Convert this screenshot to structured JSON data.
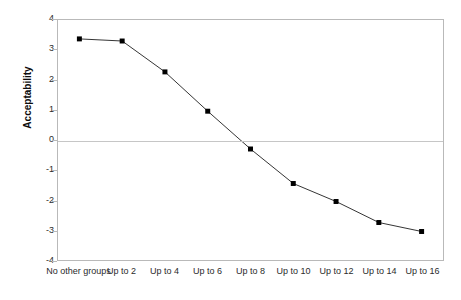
{
  "chart_data": {
    "type": "line",
    "title": "",
    "xlabel": "",
    "ylabel": "Acceptability",
    "categories": [
      "No other groups",
      "Up to 2",
      "Up to 4",
      "Up to 6",
      "Up to 8",
      "Up to 10",
      "Up to 12",
      "Up to 14",
      "Up to 16"
    ],
    "values": [
      3.37,
      3.3,
      2.27,
      0.96,
      -0.3,
      -1.45,
      -2.05,
      -2.75,
      -3.05
    ],
    "ylim": [
      -4,
      4
    ],
    "yticks": [
      4,
      3,
      2,
      1,
      0,
      -1,
      -2,
      -3,
      -4
    ],
    "ytick_labels": [
      "4",
      "3",
      "2",
      "1",
      "0",
      "-1",
      "-2",
      "-3",
      "-4"
    ],
    "grid": false,
    "zero_line": true,
    "legend": null,
    "legend_position": "none",
    "marker": "square",
    "series_color": "#333333",
    "marker_color": "#000000",
    "frame_color": "#b9b9b9",
    "zero_line_color": "#c6c6c6",
    "background": "#ffffff"
  }
}
